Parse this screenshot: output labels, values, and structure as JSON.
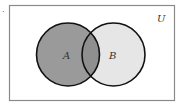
{
  "diagram": {
    "type": "venn",
    "universe": {
      "label": "U",
      "fill": "#ffffff",
      "stroke": "#888888"
    },
    "sets": [
      {
        "label": "A",
        "fill": "#9a9a9a",
        "stroke": "#111111"
      },
      {
        "label": "B",
        "fill": "#e6e6e6",
        "stroke": "#111111"
      }
    ],
    "intersection": {
      "fill": "#8c8c8c"
    },
    "marker": "."
  }
}
